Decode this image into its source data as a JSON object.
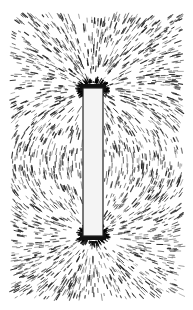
{
  "image": {
    "subject": "iron filings magnetic field pattern around a bar magnet",
    "width": 193,
    "height": 310,
    "background": "#ffffff",
    "filings_color": "#1a1a1a",
    "field_area": {
      "x": 12,
      "y": 15,
      "w": 170,
      "h": 283
    },
    "magnet": {
      "x": 83,
      "y": 88,
      "w": 20,
      "h": 148,
      "fill": "#f4f4f4"
    },
    "poles": [
      {
        "name": "top",
        "cx": 93,
        "cy": 90
      },
      {
        "name": "bottom",
        "cx": 93,
        "cy": 234
      }
    ]
  }
}
